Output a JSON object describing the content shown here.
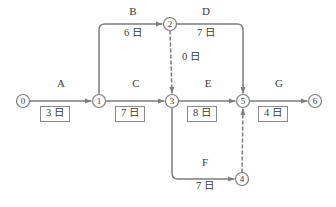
{
  "diagram": {
    "type": "activity-on-arrow-network",
    "unit_suffix": "日",
    "stroke_color": "#7d7d7d",
    "text_color": "#3a3a3a",
    "nodes": [
      {
        "id": "0",
        "label": "0",
        "x": 23,
        "y": 101
      },
      {
        "id": "1",
        "label": "1",
        "x": 99,
        "y": 101
      },
      {
        "id": "2",
        "label": "2",
        "x": 170,
        "y": 24
      },
      {
        "id": "3",
        "label": "3",
        "x": 172,
        "y": 101
      },
      {
        "id": "4",
        "label": "4",
        "x": 242,
        "y": 179
      },
      {
        "id": "5",
        "label": "5",
        "x": 243,
        "y": 101
      },
      {
        "id": "6",
        "label": "6",
        "x": 315,
        "y": 101
      }
    ],
    "activities": [
      {
        "name": "A",
        "duration": "3 日",
        "from": "0",
        "to": "1",
        "style": "solid",
        "boxed": true,
        "label_x": 61,
        "label_y": 84,
        "dur_x": 61,
        "dur_y": 112
      },
      {
        "name": "B",
        "duration": "6 日",
        "from": "1",
        "to": "2",
        "style": "solid",
        "boxed": false,
        "label_x": 133,
        "label_y": 12,
        "dur_x": 133,
        "dur_y": 33
      },
      {
        "name": "C",
        "duration": "7 日",
        "from": "1",
        "to": "3",
        "style": "solid",
        "boxed": true,
        "label_x": 136,
        "label_y": 84,
        "dur_x": 136,
        "dur_y": 112
      },
      {
        "name": "D",
        "duration": "7 日",
        "from": "2",
        "to": "5",
        "style": "solid",
        "boxed": false,
        "label_x": 206,
        "label_y": 12,
        "dur_x": 206,
        "dur_y": 33
      },
      {
        "name": "E",
        "duration": "8 日",
        "from": "3",
        "to": "5",
        "style": "solid",
        "boxed": true,
        "label_x": 208,
        "label_y": 84,
        "dur_x": 208,
        "dur_y": 112
      },
      {
        "name": "F",
        "duration": "7 日",
        "from": "3",
        "to": "4",
        "style": "solid",
        "boxed": false,
        "label_x": 205,
        "label_y": 163,
        "dur_x": 205,
        "dur_y": 186
      },
      {
        "name": "G",
        "duration": "4 日",
        "from": "5",
        "to": "6",
        "style": "solid",
        "boxed": true,
        "label_x": 279,
        "label_y": 84,
        "dur_x": 279,
        "dur_y": 112
      }
    ],
    "dummy_activities": [
      {
        "name": "",
        "duration": "0 日",
        "from": "2",
        "to": "3",
        "style": "dashed",
        "boxed": false,
        "dur_x": 190,
        "dur_y": 57
      },
      {
        "name": "",
        "duration": "",
        "from": "4",
        "to": "5",
        "style": "dashed",
        "boxed": false,
        "dur_x": 0,
        "dur_y": 0
      }
    ]
  }
}
